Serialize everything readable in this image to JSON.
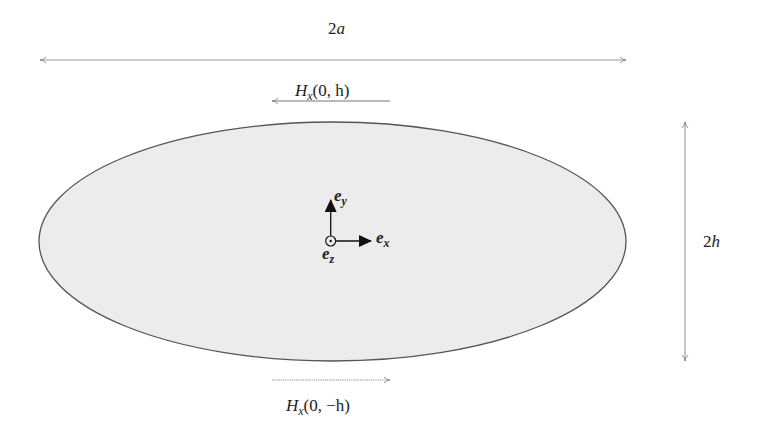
{
  "diagram": {
    "type": "ellipse-cross-section",
    "colors": {
      "ellipse_fill": "#ececec",
      "ellipse_stroke": "#555555",
      "dimension_line": "#999999",
      "axis_arrow": "#111111",
      "text": "#222222"
    },
    "dimensions": {
      "width_label": {
        "num": "2",
        "var": "a"
      },
      "height_label": {
        "num": "2",
        "var": "h"
      }
    },
    "field_labels": {
      "top": {
        "func": "H",
        "sub": "x",
        "args": "(0, h)",
        "direction": "left"
      },
      "bottom": {
        "func": "H",
        "sub": "x",
        "args": "(0, −h)",
        "direction": "right"
      }
    },
    "basis_vectors": {
      "ex": {
        "base": "e",
        "sub": "x"
      },
      "ey": {
        "base": "e",
        "sub": "y"
      },
      "ez": {
        "base": "e",
        "sub": "z"
      }
    }
  }
}
